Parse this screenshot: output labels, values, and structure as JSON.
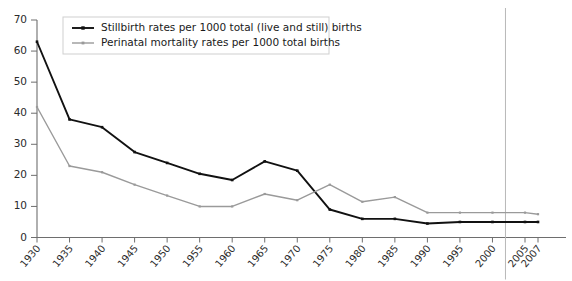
{
  "chart_data": {
    "type": "line",
    "title": "",
    "subtitle": "",
    "xlabel": "",
    "ylabel": "",
    "x": [
      1930,
      1935,
      1940,
      1945,
      1950,
      1955,
      1960,
      1965,
      1970,
      1975,
      1980,
      1985,
      1990,
      1995,
      2000,
      2005,
      2007
    ],
    "xtick_labels": [
      "1930",
      "1935",
      "1940",
      "1945",
      "1950",
      "1955",
      "1960",
      "1965",
      "1970",
      "1975",
      "1980",
      "1985",
      "1990",
      "1995",
      "2000",
      "2005",
      "2007"
    ],
    "ytick_labels": [
      "0",
      "10",
      "20",
      "30",
      "40",
      "50",
      "60",
      "70"
    ],
    "ytick_values": [
      0,
      10,
      20,
      30,
      40,
      50,
      60,
      70
    ],
    "ylim": [
      0,
      70
    ],
    "xlim": [
      1930,
      2007
    ],
    "grid": false,
    "legend_position": "top-left",
    "series": [
      {
        "name": "Stillbirth rates per 1000 total (live and still) births",
        "color": "#111111",
        "marker": "square",
        "values": [
          63,
          38,
          35.5,
          27.5,
          24,
          20.5,
          18.5,
          24.5,
          21.5,
          9,
          6,
          6,
          4.5,
          5,
          5,
          5,
          5
        ]
      },
      {
        "name": "Perinatal mortality rates per 1000 total births",
        "color": "#9a9a9a",
        "marker": "square",
        "values": [
          42,
          23,
          21,
          17,
          13.5,
          10,
          10,
          14,
          12,
          17,
          11.5,
          13,
          8,
          8,
          8,
          8,
          7.5
        ]
      }
    ],
    "annotations": [
      {
        "name": "vertical-reference-line",
        "type": "vline",
        "x": 2002,
        "color": "#b9b9b9"
      }
    ]
  },
  "legend": {
    "entries": [
      {
        "label": "Stillbirth rates per 1000 total (live and still) births"
      },
      {
        "label": "Perinatal mortality rates per 1000 total births"
      }
    ]
  }
}
